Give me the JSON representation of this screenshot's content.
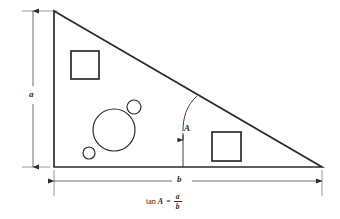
{
  "figure": {
    "background_color": "#ffffff",
    "line_color": "#2b2b2b",
    "labels": {
      "leg_vertical": "a",
      "leg_horizontal": "b",
      "angle": "A"
    },
    "formula": {
      "function": "tan",
      "angle_var": "A",
      "equals": "=",
      "numerator": "a",
      "denominator": "b",
      "full_text": "tan A = a/b"
    },
    "shapes": {
      "triangle": {
        "type": "right-triangle",
        "apex": [
          54,
          11
        ],
        "bottom_left": [
          54,
          167
        ],
        "bottom_right": [
          322,
          167
        ]
      },
      "squares": [
        {
          "name": "upper-left-square",
          "x": 71,
          "y": 51,
          "size": 28
        },
        {
          "name": "lower-right-square",
          "x": 212,
          "y": 132,
          "size": 29
        }
      ],
      "circles": [
        {
          "name": "large-circle",
          "cx": 114,
          "cy": 130,
          "r": 21
        },
        {
          "name": "medium-circle",
          "cx": 134,
          "cy": 107,
          "r": 7
        },
        {
          "name": "small-circle",
          "cx": 89,
          "cy": 153,
          "r": 6
        }
      ],
      "angle_arc": {
        "vertex": [
          183,
          167
        ],
        "radius": 62,
        "leader_x": 183
      }
    },
    "dimensions": {
      "vertical": {
        "x": 33,
        "y_top": 11,
        "y_bottom": 167
      },
      "horizontal": {
        "y": 181,
        "x_left": 54,
        "x_right": 322
      }
    }
  }
}
